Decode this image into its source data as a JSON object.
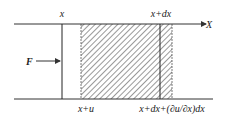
{
  "diagram": {
    "type": "bar-element-displacement",
    "axis_label": "X",
    "force_label": "F",
    "top_labels": {
      "left_section": "x",
      "right_section": "x+dx"
    },
    "bottom_labels": {
      "displaced_left": "x+u",
      "displaced_right": "x+dx+(∂u/∂x)dx"
    },
    "colors": {
      "line": "#333333",
      "hatch": "#444444",
      "background": "#ffffff"
    }
  }
}
